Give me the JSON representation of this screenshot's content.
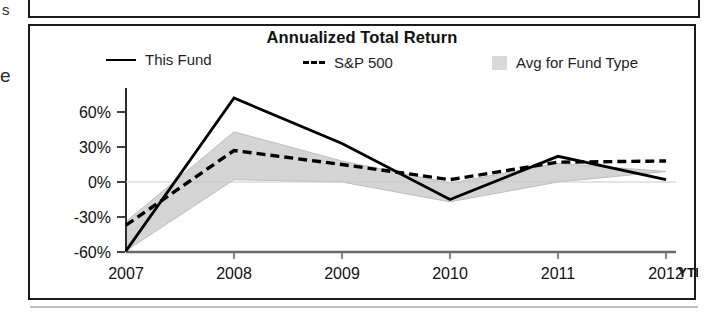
{
  "scan_fragments": {
    "top_left_letter": "s",
    "mid_left_letter": "e"
  },
  "chart": {
    "title": "Annualized Total Return",
    "legend": [
      {
        "label": "This Fund",
        "marker": "solid-line",
        "color": "#000000"
      },
      {
        "label": "S&P 500",
        "marker": "dashed-line",
        "color": "#000000"
      },
      {
        "label": "Avg for Fund Type",
        "marker": "filled-square",
        "color": "#d2d2d2"
      }
    ],
    "ytd_note": "YTD"
  },
  "chart_data": {
    "type": "line",
    "title": "Annualized Total Return",
    "xlabel": "",
    "ylabel": "",
    "categories": [
      "2007",
      "2008",
      "2009",
      "2010",
      "2011",
      "2012"
    ],
    "x_tick_labels": [
      "2007",
      "2008",
      "2009",
      "2010",
      "2011",
      "2012"
    ],
    "y_tick_labels": [
      "60%",
      "30%",
      "0%",
      "-30%",
      "-60%"
    ],
    "y_ticks": [
      60,
      30,
      0,
      -30,
      -60
    ],
    "ylim": [
      -60,
      80
    ],
    "grid": false,
    "legend_position": "top",
    "series": [
      {
        "name": "This Fund",
        "style": "solid",
        "color": "#000000",
        "values": [
          -59,
          72,
          33,
          -15,
          22,
          2
        ]
      },
      {
        "name": "S&P 500",
        "style": "dashed",
        "color": "#000000",
        "values": [
          -37,
          27,
          15,
          2,
          17,
          18
        ]
      },
      {
        "name": "Avg for Fund Type",
        "style": "band",
        "color": "#d2d2d2",
        "band_upper": [
          -34,
          43,
          18,
          -1,
          16,
          9
        ],
        "band_lower": [
          -59,
          2,
          0,
          -17,
          0,
          9
        ]
      }
    ],
    "annotations": [
      {
        "text": "YTD",
        "x": "2012",
        "position": "axis-right",
        "bold": true
      }
    ]
  }
}
